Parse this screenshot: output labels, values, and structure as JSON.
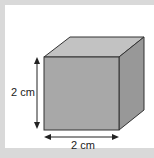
{
  "diagram": {
    "shape": "cube",
    "height_label": "2 cm",
    "width_label": "2 cm",
    "colors": {
      "background": "#d9d9d9",
      "panel": "#ffffff",
      "front_face": "#a8a8a8",
      "top_face": "#c2c2c2",
      "side_face": "#989898",
      "edge": "#333333"
    }
  }
}
